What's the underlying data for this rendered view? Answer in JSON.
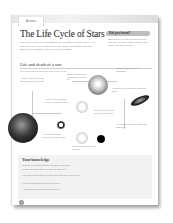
{
  "header": {
    "tab_label": "Activities",
    "title": "The Life Cycle of Stars",
    "intro": "Our Sun will use up its hydrogen fuel in about 5 billion years. As it runs out it will swell into a red giant. Bigger stars burn their fuel much faster and may end their lives far sooner."
  },
  "did_you_know": {
    "heading": "Did you know?",
    "body": "Stars are born in vast clouds of gas and dust called nebulae, which collapse under gravity until fusion begins."
  },
  "section": {
    "title": "Life and death of a star",
    "subtitle": "Stars follow different paths depending on their mass."
  },
  "diagram": {
    "captions": [
      "A nebula: a cloud of gas and dust collapses to form a star.",
      "A star like our Sun shines steadily for billions of years.",
      "Smaller stars swell into red giants as fuel runs out.",
      "Massive stars become red supergiants.",
      "A supernova explosion blasts matter into space.",
      "The remaining core may become a neutron star.",
      "Very massive stars may collapse into a black hole.",
      "A red giant sheds outer layers leaving a white dwarf.",
      "The white dwarf slowly cools and fades."
    ]
  },
  "knowledge": {
    "title": "Your knowledge",
    "intro": "Complete the activities using the information on this page.",
    "questions": [
      "1. Name the stage a star like our Sun will reach next.",
      "2. Describe how the path of a massive star differs from a smaller one.",
      "3. Explain what happens during a supernova.",
      "4. Suggest why some stars form black holes."
    ]
  },
  "footer": {
    "page_number": "8"
  }
}
